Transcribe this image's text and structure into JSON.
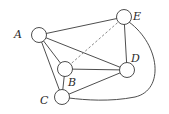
{
  "diagram": {
    "type": "graph",
    "nodes": [
      {
        "id": "A",
        "label": "A",
        "x": 39,
        "y": 35,
        "label_x": 14,
        "label_y": 38
      },
      {
        "id": "E",
        "label": "E",
        "x": 124,
        "y": 17,
        "label_x": 133,
        "label_y": 20
      },
      {
        "id": "B",
        "label": "B",
        "x": 65,
        "y": 69,
        "label_x": 68,
        "label_y": 86
      },
      {
        "id": "D",
        "label": "D",
        "x": 127,
        "y": 70,
        "label_x": 131,
        "label_y": 62
      },
      {
        "id": "C",
        "label": "C",
        "x": 62,
        "y": 97,
        "label_x": 40,
        "label_y": 104
      }
    ],
    "edges": [
      {
        "from": "A",
        "to": "E",
        "style": "solid"
      },
      {
        "from": "A",
        "to": "D",
        "style": "solid"
      },
      {
        "from": "A",
        "to": "B",
        "style": "solid"
      },
      {
        "from": "A",
        "to": "C",
        "style": "solid"
      },
      {
        "from": "B",
        "to": "E",
        "style": "dashed"
      },
      {
        "from": "B",
        "to": "D",
        "style": "solid"
      },
      {
        "from": "B",
        "to": "C",
        "style": "solid"
      },
      {
        "from": "E",
        "to": "D",
        "style": "solid"
      },
      {
        "from": "C",
        "to": "D",
        "style": "solid"
      },
      {
        "from": "E",
        "to": "C",
        "style": "curved"
      }
    ],
    "node_radius": 7.5
  }
}
